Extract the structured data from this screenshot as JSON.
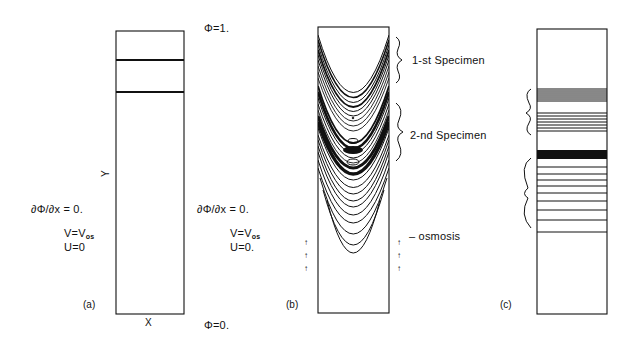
{
  "panel_a": {
    "letter": "(a)",
    "top_bc": "Φ=1.",
    "bottom_bc": "Φ=0.",
    "x_axis": "X",
    "y_axis": "Y",
    "left_bc": {
      "neumann": "∂Φ/∂x  =  0.",
      "v_label": "V=V",
      "v_sub": "os",
      "u_label": "U=0"
    },
    "right_bc": {
      "neumann": "∂Φ/∂x  =  0.",
      "v_label": "V=V",
      "v_sub": "os",
      "u_label": "U=0."
    },
    "specimen_lines_y": [
      60,
      92
    ]
  },
  "panel_b": {
    "letter": "(b)",
    "specimen_1": "1-st  Specimen",
    "specimen_2": "2-nd  Specimen",
    "osmosis": "– osmosis",
    "arrow_glyph": "↑"
  },
  "panel_c": {
    "letter": "(c)",
    "band_lines_y": [
      89,
      91,
      93,
      95,
      97,
      99,
      101,
      113,
      116,
      119,
      122,
      125,
      128,
      131,
      167,
      174,
      180,
      186,
      193,
      201,
      210,
      220,
      232
    ],
    "solid_band": [
      150,
      159
    ]
  }
}
